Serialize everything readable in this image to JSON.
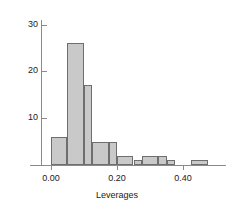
{
  "chart_data": {
    "type": "bar",
    "title": "",
    "subtitle": "",
    "xlabel": "Leverages",
    "ylabel": "",
    "xlim": [
      -0.03,
      0.53
    ],
    "ylim": [
      0,
      31
    ],
    "grid": false,
    "legend": null,
    "bin_width": 0.025,
    "xticks": [
      0.0,
      0.2,
      0.4
    ],
    "xtick_labels": [
      "0.00",
      "0.20",
      "0.40"
    ],
    "yticks": [
      10,
      20,
      30
    ],
    "ytick_labels": [
      "10",
      "20",
      "30"
    ],
    "bin_edges": [
      0.0,
      0.025,
      0.05,
      0.075,
      0.1,
      0.125,
      0.15,
      0.175,
      0.2,
      0.225,
      0.25,
      0.275,
      0.3,
      0.325,
      0.35,
      0.375,
      0.4,
      0.425,
      0.45,
      0.475
    ],
    "categories": [
      "0.000-0.025",
      "0.025-0.050",
      "0.050-0.075",
      "0.075-0.100",
      "0.100-0.125",
      "0.125-0.150",
      "0.150-0.175",
      "0.175-0.200",
      "0.200-0.225",
      "0.225-0.250",
      "0.250-0.275",
      "0.275-0.300",
      "0.300-0.325",
      "0.325-0.350",
      "0.350-0.375",
      "0.375-0.400",
      "0.400-0.425",
      "0.425-0.450",
      "0.450-0.475"
    ],
    "values": [
      6,
      6,
      26,
      26,
      17,
      17,
      5,
      5,
      5,
      2,
      1,
      2,
      2,
      2,
      2,
      1,
      0,
      1,
      1
    ],
    "bars": [
      {
        "left": 0.0,
        "right": 0.05,
        "height": 6
      },
      {
        "left": 0.05,
        "right": 0.1,
        "height": 26
      },
      {
        "left": 0.1,
        "right": 0.125,
        "height": 17
      },
      {
        "left": 0.125,
        "right": 0.175,
        "height": 5
      },
      {
        "left": 0.175,
        "right": 0.2,
        "height": 5
      },
      {
        "left": 0.2,
        "right": 0.25,
        "height": 2
      },
      {
        "left": 0.25,
        "right": 0.275,
        "height": 1
      },
      {
        "left": 0.275,
        "right": 0.325,
        "height": 2
      },
      {
        "left": 0.325,
        "right": 0.35,
        "height": 2
      },
      {
        "left": 0.35,
        "right": 0.375,
        "height": 1
      },
      {
        "left": 0.425,
        "right": 0.475,
        "height": 1
      }
    ],
    "bar_fill_color": "#c9c9c9",
    "bar_edge_color": "#6e6e6e",
    "axis_color": "#8a8a8a",
    "text_color": "#1a1a1a"
  }
}
